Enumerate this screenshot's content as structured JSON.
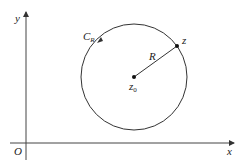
{
  "diagram": {
    "x_axis_label": "x",
    "y_axis_label": "y",
    "origin_label": "O",
    "curve_label": "C",
    "curve_label_sub": "R",
    "radius_label": "R",
    "center_label": "z",
    "center_label_sub": "0",
    "point_label": "z",
    "colors": {
      "stroke": "#333333",
      "background": "#ffffff"
    }
  }
}
